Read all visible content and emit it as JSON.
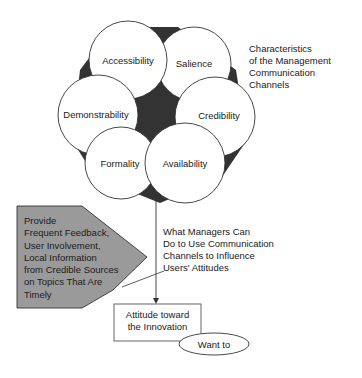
{
  "diagram": {
    "characteristics_title": [
      "Characteristics",
      "of the Management",
      "Communication",
      "Channels"
    ],
    "circles": [
      {
        "id": "accessibility",
        "label": "Accessibility",
        "cx": 128,
        "cy": 60,
        "r": 39
      },
      {
        "id": "salience",
        "label": "Salience",
        "cx": 194,
        "cy": 64,
        "r": 37
      },
      {
        "id": "demonstrability",
        "label": "Demonstrability",
        "cx": 98,
        "cy": 115,
        "r": 40
      },
      {
        "id": "credibility",
        "label": "Credibility",
        "cx": 215,
        "cy": 117,
        "r": 40
      },
      {
        "id": "formality",
        "label": "Formality",
        "cx": 121,
        "cy": 163,
        "r": 36
      },
      {
        "id": "availability",
        "label": "Availability",
        "cx": 185,
        "cy": 163,
        "r": 40
      }
    ],
    "managers_label": [
      "What Managers Can",
      "Do to Use Communication",
      "Channels to Influence",
      "Users' Attitudes"
    ],
    "callout": {
      "lines": [
        "Provide",
        "Frequent Feedback,",
        "User Involvement,",
        "Local Information",
        "from Credible Sources",
        "on Topics That Are",
        "Timely"
      ],
      "fill": "#9a9a9a"
    },
    "outcome_box": {
      "lines": [
        "Attitude toward",
        "the Innovation"
      ]
    },
    "outcome_ellipse": {
      "label": "Want to"
    },
    "colors": {
      "dark_fill": "#333333",
      "stroke": "#333333",
      "circle_fill": "#ffffff"
    }
  }
}
